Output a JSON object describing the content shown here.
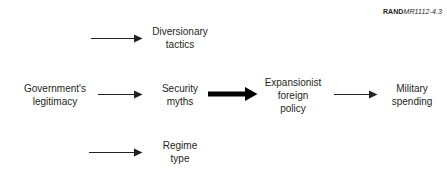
{
  "figure": {
    "id_brand": "RAND",
    "id_code": "MR1112-4.3",
    "background_color": "#ffffff",
    "ink_color": "#231f20"
  },
  "nodes": {
    "legitimacy": "Government's\nlegitimacy",
    "diversionary": "Diversionary\ntactics",
    "security": "Security\nmyths",
    "regime": "Regime\ntype",
    "expansionist": "Expansionist\nforeign\npolicy",
    "military": "Military\nspending"
  },
  "arrows": [
    {
      "name": "legitimacy-to-diversionary",
      "style": "thin",
      "direction": "right"
    },
    {
      "name": "legitimacy-to-security",
      "style": "thin",
      "direction": "right"
    },
    {
      "name": "legitimacy-to-regime",
      "style": "thin",
      "direction": "right"
    },
    {
      "name": "security-to-expansionist",
      "style": "thick",
      "direction": "right"
    },
    {
      "name": "expansionist-to-military",
      "style": "thin",
      "direction": "right"
    }
  ]
}
